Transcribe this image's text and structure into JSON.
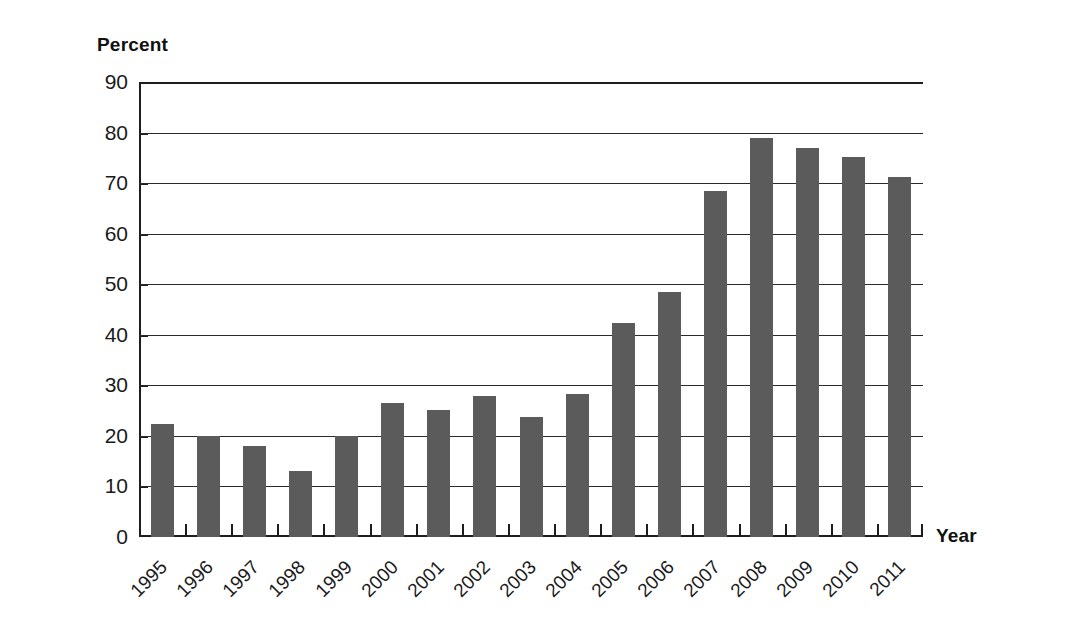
{
  "chart_data": {
    "type": "bar",
    "title": "",
    "subtitle": "",
    "ylabel": "Percent",
    "xlabel": "Year",
    "ylim": [
      0,
      90
    ],
    "ytick_step": 10,
    "yticks": [
      "0",
      "10",
      "20",
      "30",
      "40",
      "50",
      "60",
      "70",
      "80",
      "90"
    ],
    "grid": true,
    "legend": false,
    "legend_position": "none",
    "bar_color": "#5b5b5b",
    "axis_color": "#1d1d1d",
    "background_color": "#ffffff",
    "categories": [
      "1995",
      "1996",
      "1997",
      "1998",
      "1999",
      "2000",
      "2001",
      "2002",
      "2003",
      "2004",
      "2005",
      "2006",
      "2007",
      "2008",
      "2009",
      "2010",
      "2011"
    ],
    "values": [
      22.4,
      20.0,
      18.0,
      13.1,
      19.9,
      26.5,
      25.2,
      27.8,
      23.7,
      28.2,
      42.3,
      48.4,
      68.4,
      79.0,
      77.0,
      75.2,
      71.2
    ],
    "annotations": []
  }
}
